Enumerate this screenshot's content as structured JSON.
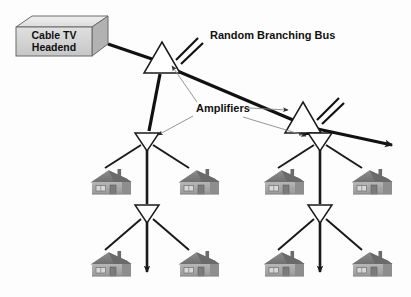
{
  "figure": {
    "type": "network-topology-diagram",
    "background_color": "#fdfdfd",
    "width": 411,
    "height": 297
  },
  "labels": {
    "title": "Random Branching Bus",
    "amplifiers": "Amplifiers",
    "headend_line1": "Cable TV",
    "headend_line2": "Headend"
  },
  "colors": {
    "line": "#111111",
    "leader": "#8a8a8a",
    "amp_fill": "#ffffff",
    "box_face": "#d4d4d4",
    "box_top": "#e8e8e8",
    "box_side": "#b4b4b4",
    "house_wall": "#a8a8a8",
    "house_roof": "#7e7e7e",
    "text": "#111111"
  },
  "nodes": {
    "headend": {
      "name": "Cable TV Headend",
      "x": 16,
      "y": 16,
      "w": 92,
      "h": 44
    },
    "amplifiers": [
      {
        "id": "amp-trunk-1",
        "orientation": "up",
        "x": 162,
        "y": 57,
        "size": 17,
        "stubs": 2
      },
      {
        "id": "amp-trunk-2",
        "orientation": "up",
        "x": 303,
        "y": 117,
        "size": 17,
        "stubs": 2
      },
      {
        "id": "amp-left-1",
        "orientation": "down",
        "x": 147,
        "y": 140,
        "size": 11,
        "stubs": 0
      },
      {
        "id": "amp-left-2",
        "orientation": "down",
        "x": 147,
        "y": 212,
        "size": 11,
        "stubs": 0
      },
      {
        "id": "amp-right-1",
        "orientation": "down",
        "x": 320,
        "y": 140,
        "size": 11,
        "stubs": 0
      },
      {
        "id": "amp-right-2",
        "orientation": "down",
        "x": 320,
        "y": 212,
        "size": 11,
        "stubs": 0
      }
    ],
    "houses": [
      {
        "id": "house-l-mid-left",
        "x": 87,
        "y": 167
      },
      {
        "id": "house-l-mid-right",
        "x": 175,
        "y": 167
      },
      {
        "id": "house-r-mid-left",
        "x": 260,
        "y": 167
      },
      {
        "id": "house-r-mid-right",
        "x": 348,
        "y": 167
      },
      {
        "id": "house-l-bot-left",
        "x": 87,
        "y": 249
      },
      {
        "id": "house-l-bot-right",
        "x": 175,
        "y": 249
      },
      {
        "id": "house-r-bot-left",
        "x": 260,
        "y": 249
      },
      {
        "id": "house-r-bot-right",
        "x": 348,
        "y": 249
      }
    ]
  },
  "text_positions": {
    "title": {
      "x": 210,
      "y": 39
    },
    "amplifiers": {
      "x": 196,
      "y": 112
    }
  },
  "counts": {
    "amplifiers": 6,
    "houses": 8,
    "terminating_arrows": 3
  }
}
